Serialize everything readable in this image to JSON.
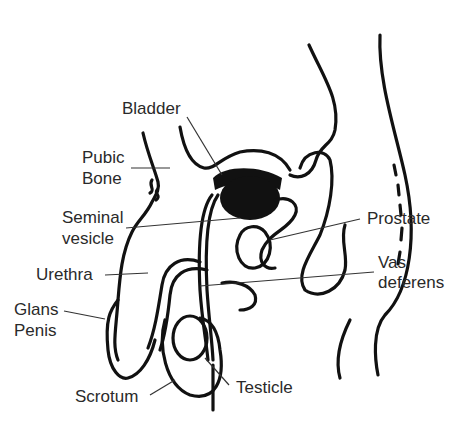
{
  "diagram": {
    "labels": [
      {
        "id": "bladder",
        "text": "Bladder"
      },
      {
        "id": "pubic_bone_1",
        "text": "Pubic"
      },
      {
        "id": "pubic_bone_2",
        "text": "Bone"
      },
      {
        "id": "seminal_vesicle_1",
        "text": "Seminal"
      },
      {
        "id": "seminal_vesicle_2",
        "text": "vesicle"
      },
      {
        "id": "prostate",
        "text": "Prostate"
      },
      {
        "id": "urethra",
        "text": "Urethra"
      },
      {
        "id": "vas_deferens_1",
        "text": "Vas"
      },
      {
        "id": "vas_deferens_2",
        "text": "deferens"
      },
      {
        "id": "glans_penis_1",
        "text": "Glans"
      },
      {
        "id": "glans_penis_2",
        "text": "Penis"
      },
      {
        "id": "scrotum",
        "text": "Scrotum"
      },
      {
        "id": "testicle",
        "text": "Testicle"
      }
    ],
    "colors": {
      "ink": "#111111",
      "label": "#2a2a2a",
      "background": "#ffffff"
    }
  }
}
